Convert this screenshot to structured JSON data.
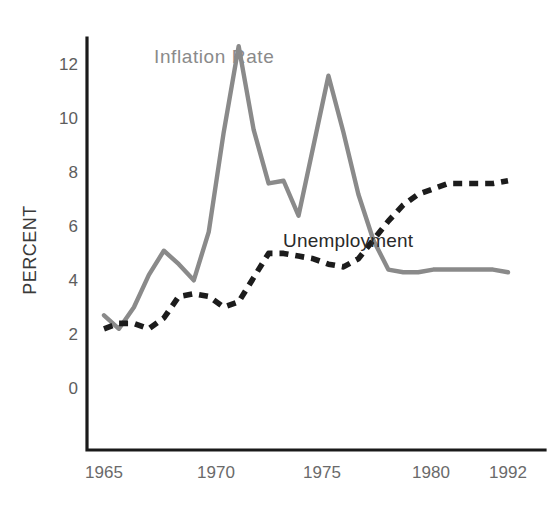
{
  "chart_data": {
    "type": "line",
    "title": "",
    "xlabel": "",
    "ylabel": "PERCENT",
    "xlim": [
      1965,
      1992
    ],
    "ylim": [
      0,
      13
    ],
    "grid": false,
    "legend_position": "inline-annotations",
    "x_ticks": [
      "1965",
      "1970",
      "1975",
      "1980",
      "1992"
    ],
    "x_tick_values": [
      1965,
      1970,
      1975,
      1980,
      1992
    ],
    "y_ticks": [
      "0",
      "2",
      "4",
      "6",
      "8",
      "10",
      "12"
    ],
    "y_tick_values": [
      0,
      2,
      4,
      6,
      8,
      10,
      12
    ],
    "x": [
      1965,
      1966,
      1967,
      1968,
      1969,
      1970,
      1971,
      1972,
      1973,
      1974,
      1975,
      1976,
      1977,
      1978,
      1979,
      1980,
      1981,
      1982,
      1983,
      1984,
      1985,
      1986,
      1987,
      1988,
      1989,
      1990,
      1991,
      1992
    ],
    "series": [
      {
        "name": "Inflation Rate",
        "style": "solid",
        "color": "#8a8a8a",
        "values": [
          2.7,
          2.2,
          3.0,
          4.2,
          5.1,
          4.6,
          4.0,
          5.8,
          9.5,
          12.7,
          9.6,
          7.6,
          7.7,
          6.4,
          9.0,
          11.6,
          9.5,
          7.2,
          5.5,
          4.4,
          4.3,
          4.3,
          4.4,
          4.4,
          4.4,
          4.4,
          4.4,
          4.3
        ]
      },
      {
        "name": "Unemployment",
        "style": "dashed",
        "color": "#1c1c1c",
        "values": [
          2.2,
          2.4,
          2.4,
          2.2,
          2.6,
          3.4,
          3.5,
          3.4,
          3.0,
          3.2,
          4.1,
          5.0,
          5.0,
          4.9,
          4.8,
          4.6,
          4.5,
          4.8,
          5.5,
          6.2,
          6.8,
          7.2,
          7.4,
          7.6,
          7.6,
          7.6,
          7.6,
          7.7
        ]
      }
    ],
    "annotations": [
      {
        "text": "Inflation Rate",
        "series": "Inflation Rate"
      },
      {
        "text": "Unemployment",
        "series": "Unemployment"
      }
    ]
  },
  "figure": {
    "background": "#ffffff",
    "axis_color": "#1a1a1a"
  }
}
